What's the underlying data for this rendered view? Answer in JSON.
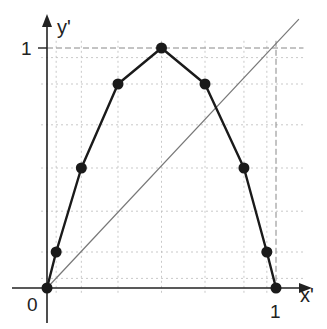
{
  "chart_data": {
    "type": "line",
    "title": "",
    "xlabel": "x'",
    "ylabel": "y'",
    "xlim": [
      0,
      1
    ],
    "ylim": [
      0,
      1
    ],
    "x_ticks": [
      "0",
      "1"
    ],
    "y_ticks": [
      "1"
    ],
    "origin_label": "0",
    "grid": true,
    "legend": null,
    "series": [
      {
        "name": "map",
        "style": "thick line with filled circle markers",
        "x": [
          0,
          0.04,
          0.15,
          0.31,
          0.5,
          0.69,
          0.86,
          0.96,
          1
        ],
        "y": [
          0,
          0.15,
          0.5,
          0.85,
          1,
          0.85,
          0.5,
          0.15,
          0
        ]
      },
      {
        "name": "identity diagonal y'=x'",
        "style": "thin gray line",
        "x": [
          0,
          1.1
        ],
        "y": [
          0,
          1.12
        ]
      }
    ],
    "reference_lines": [
      {
        "type": "horizontal",
        "y": 1,
        "style": "dashed"
      },
      {
        "type": "vertical",
        "x": 1,
        "style": "dashed"
      }
    ],
    "grid_x": [
      0.04,
      0.15,
      0.31,
      0.5,
      0.69,
      0.86,
      0.96
    ],
    "grid_y": [
      0.04,
      0.15,
      0.32,
      0.5,
      0.68,
      0.85,
      0.96
    ]
  },
  "labels": {
    "x_axis": "x'",
    "y_axis": "y'",
    "x_one": "1",
    "y_one": "1",
    "origin": "0"
  },
  "colors": {
    "axis": "#222222",
    "curve": "#1a1a1a",
    "diagonal": "#777777",
    "grid": "#bbbbbb",
    "dashed": "#888888"
  }
}
